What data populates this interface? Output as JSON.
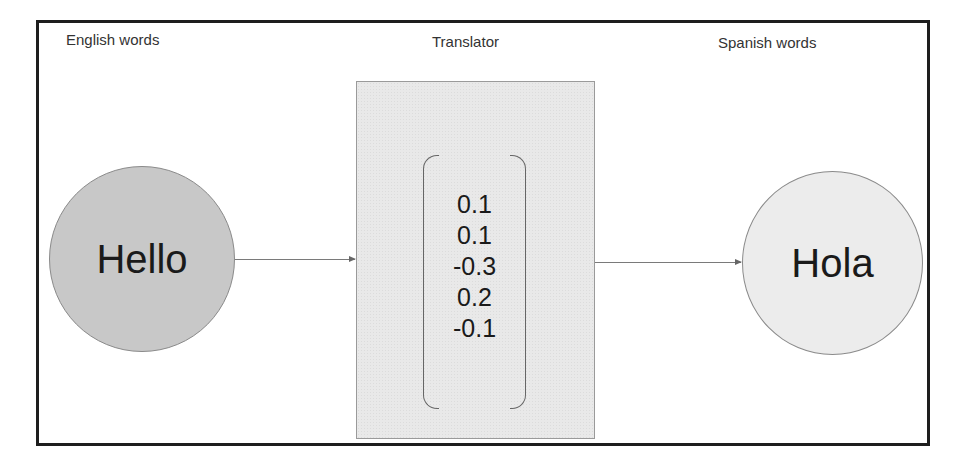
{
  "labels": {
    "english": "English words",
    "translator": "Translator",
    "spanish": "Spanish words"
  },
  "input_node": {
    "word": "Hello",
    "fill": "#c8c8c8"
  },
  "output_node": {
    "word": "Hola",
    "fill": "#ececec"
  },
  "translator": {
    "vector": [
      "0.1",
      "0.1",
      "-0.3",
      "0.2",
      "-0.1"
    ]
  },
  "edges": [
    {
      "from": "Hello",
      "to": "Translator"
    },
    {
      "from": "Translator",
      "to": "Hola"
    }
  ]
}
